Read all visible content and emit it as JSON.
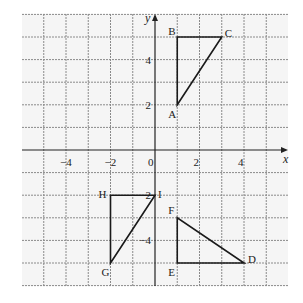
{
  "diagram": {
    "type": "coordinate-grid",
    "background": "#f5f5f5",
    "grid_color": "#8a8a8a",
    "axis_color": "#222222",
    "shape_color": "#1a1a1a",
    "x_range": [
      -6,
      6
    ],
    "y_range": [
      -6,
      6
    ],
    "axes": {
      "x_label": "x",
      "y_label": "y"
    },
    "x_ticks": [
      {
        "value": -4,
        "label": "−4"
      },
      {
        "value": -2,
        "label": "−2"
      },
      {
        "value": 0,
        "label": "0"
      },
      {
        "value": 2,
        "label": "2"
      },
      {
        "value": 4,
        "label": "4"
      }
    ],
    "y_ticks": [
      {
        "value": 4,
        "label": "4"
      },
      {
        "value": 2,
        "label": "2"
      },
      {
        "value": -2,
        "label": "−2"
      },
      {
        "value": -4,
        "label": "−4"
      }
    ],
    "triangles": [
      {
        "name": "ABC",
        "vertices": [
          {
            "label": "A",
            "x": 1,
            "y": 2
          },
          {
            "label": "B",
            "x": 1,
            "y": 5
          },
          {
            "label": "C",
            "x": 3,
            "y": 5
          }
        ]
      },
      {
        "name": "DEF",
        "vertices": [
          {
            "label": "D",
            "x": 4,
            "y": -5
          },
          {
            "label": "E",
            "x": 1,
            "y": -5
          },
          {
            "label": "F",
            "x": 1,
            "y": -3
          }
        ]
      },
      {
        "name": "GHI",
        "vertices": [
          {
            "label": "G",
            "x": -2,
            "y": -5
          },
          {
            "label": "H",
            "x": -2,
            "y": -2
          },
          {
            "label": "I",
            "x": 0,
            "y": -2
          }
        ]
      }
    ]
  }
}
